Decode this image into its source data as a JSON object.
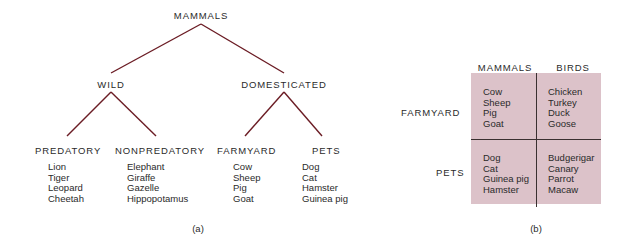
{
  "colors": {
    "tree_line": "#6b1c24",
    "grid_bg": "#dcc2c9",
    "grid_line": "#3a3030",
    "text": "#2a2a2a"
  },
  "tree": {
    "root": "MAMMALS",
    "level2": [
      {
        "label": "WILD"
      },
      {
        "label": "DOMESTICATED"
      }
    ],
    "level3": [
      {
        "label": "PREDATORY",
        "items": [
          "Lion",
          "Tiger",
          "Leopard",
          "Cheetah"
        ]
      },
      {
        "label": "NONPREDATORY",
        "items": [
          "Elephant",
          "Giraffe",
          "Gazelle",
          "Hippopotamus"
        ]
      },
      {
        "label": "FARMYARD",
        "items": [
          "Cow",
          "Sheep",
          "Pig",
          "Goat"
        ]
      },
      {
        "label": "PETS",
        "items": [
          "Dog",
          "Cat",
          "Hamster",
          "Guinea pig"
        ]
      }
    ],
    "caption": "(a)"
  },
  "matrix": {
    "columns": [
      "MAMMALS",
      "BIRDS"
    ],
    "rows": [
      "FARMYARD",
      "PETS"
    ],
    "cells": [
      [
        [
          "Cow",
          "Sheep",
          "Pig",
          "Goat"
        ],
        [
          "Chicken",
          "Turkey",
          "Duck",
          "Goose"
        ]
      ],
      [
        [
          "Dog",
          "Cat",
          "Guinea pig",
          "Hamster"
        ],
        [
          "Budgerigar",
          "Canary",
          "Parrot",
          "Macaw"
        ]
      ]
    ],
    "caption": "(b)"
  }
}
